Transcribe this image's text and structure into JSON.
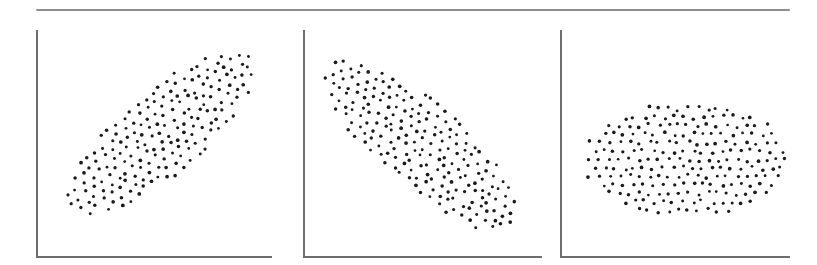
{
  "figure": {
    "type": "scatter-panel-series",
    "background_color": "#ffffff",
    "dot_color": "#1a1a1a",
    "axis_color": "#6e6e6e",
    "rule_color": "#8e8e8e",
    "top_rule": {
      "x": 36,
      "y": 9,
      "width": 754,
      "height": 2
    }
  },
  "panels": [
    {
      "id": "panel-positive-correlation",
      "name": "positive-correlation-scatterplot",
      "left": 36,
      "width": 236,
      "axes": {
        "x_axis": true,
        "y_axis": true
      },
      "ellipse": {
        "cx": 124,
        "cy": 105,
        "rx": 118,
        "ry": 40,
        "rotation_deg": -40
      },
      "point_count": 236,
      "grid_spacing": 9.6,
      "jitter": 2.2,
      "seed": 17
    },
    {
      "id": "panel-negative-correlation",
      "name": "negative-correlation-scatterplot",
      "left": 303,
      "width": 239,
      "axes": {
        "x_axis": true,
        "y_axis": true
      },
      "ellipse": {
        "cx": 118,
        "cy": 115,
        "rx": 122,
        "ry": 42,
        "rotation_deg": 40
      },
      "point_count": 244,
      "grid_spacing": 9.6,
      "jitter": 2.2,
      "seed": 43
    },
    {
      "id": "panel-zero-correlation",
      "name": "zero-correlation-scatterplot",
      "left": 560,
      "width": 230,
      "axes": {
        "x_axis": true,
        "y_axis": true
      },
      "ellipse": {
        "cx": 126,
        "cy": 130,
        "rx": 101,
        "ry": 58,
        "rotation_deg": 0
      },
      "point_count": 212,
      "grid_spacing": 9.8,
      "jitter": 2.3,
      "seed": 91
    }
  ],
  "chart_data": {
    "type": "scatter",
    "title": "",
    "subtitle": "",
    "xlabel": "",
    "ylabel": "",
    "grid": false,
    "legend": "none",
    "tick_labels": {
      "x": [],
      "y": []
    },
    "annotations": [],
    "panels": [
      {
        "name": "positive-correlation-scatterplot",
        "relationship": "positive linear association",
        "correlation_sign": "+",
        "approx_r": 0.9,
        "cloud_shape": "narrow ellipse tilted up to the right",
        "tilt_deg": -40,
        "n_points": 236,
        "marker": "filled circle",
        "marker_size_px": 3.4
      },
      {
        "name": "negative-correlation-scatterplot",
        "relationship": "negative linear association",
        "correlation_sign": "-",
        "approx_r": -0.9,
        "cloud_shape": "narrow ellipse tilted down to the right",
        "tilt_deg": 40,
        "n_points": 244,
        "marker": "filled circle",
        "marker_size_px": 3.4
      },
      {
        "name": "zero-correlation-scatterplot",
        "relationship": "no association",
        "correlation_sign": "0",
        "approx_r": 0.0,
        "cloud_shape": "horizontal ellipse, untilted",
        "tilt_deg": 0,
        "n_points": 212,
        "marker": "filled circle",
        "marker_size_px": 3.4
      }
    ]
  }
}
